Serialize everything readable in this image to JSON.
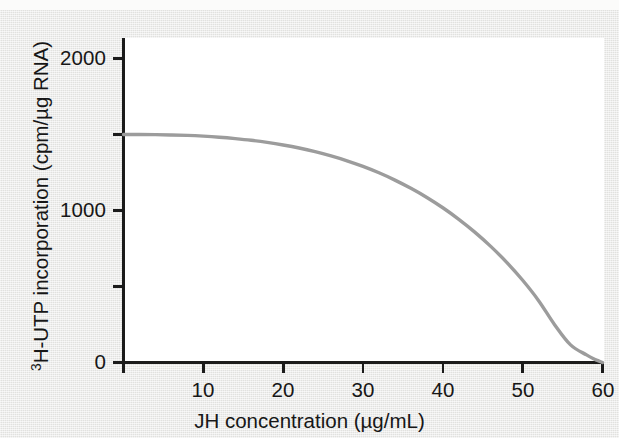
{
  "figure": {
    "background_color": "#e6e6e4",
    "panel_color": "#ffffff",
    "axis_color": "#1b1b1b"
  },
  "axis_titles": {
    "x": "JH concentration (µg/mL)",
    "y_superscript": "3",
    "y_rest": "H-UTP incorporation (cpm/µg RNA)",
    "y_full": "3H-UTP incorporation (cpm/µg RNA)"
  },
  "ticks": {
    "x_labels": [
      "10",
      "20",
      "30",
      "40",
      "50",
      "60"
    ],
    "y_labels": [
      "0",
      "1000",
      "2000"
    ]
  },
  "chart_data": {
    "type": "line",
    "title": "",
    "subtitle": "",
    "xlabel": "JH concentration (µg/mL)",
    "ylabel": "3H-UTP incorporation (cpm/µg RNA)",
    "xlim": [
      0,
      60
    ],
    "ylim": [
      0,
      2200
    ],
    "x_ticks": [
      0,
      10,
      20,
      30,
      40,
      50,
      60
    ],
    "x_tick_labels": [
      "",
      "10",
      "20",
      "30",
      "40",
      "50",
      "60"
    ],
    "y_ticks": [
      0,
      500,
      1000,
      1500,
      2000
    ],
    "y_tick_labels": [
      "0",
      "",
      "1000",
      "",
      "2000"
    ],
    "grid": false,
    "legend": false,
    "legend_position": "none",
    "series": [
      {
        "name": "3H-UTP incorporation",
        "color": "#9c9c9c",
        "line_width": 3.4,
        "markers": false,
        "x": [
          0,
          2,
          4,
          6,
          8,
          10,
          12,
          14,
          16,
          18,
          20,
          22,
          24,
          26,
          28,
          30,
          32,
          34,
          36,
          38,
          40,
          42,
          44,
          46,
          48,
          50,
          52,
          54,
          56,
          58,
          59,
          59.5,
          60
        ],
        "y": [
          1500,
          1500,
          1499,
          1497,
          1494,
          1489,
          1482,
          1473,
          1462,
          1448,
          1431,
          1411,
          1387,
          1359,
          1327,
          1290,
          1248,
          1200,
          1146,
          1086,
          1018,
          942,
          858,
          764,
          659,
          541,
          407,
          249,
          116,
          50,
          22,
          11,
          0
        ]
      }
    ],
    "annotations": []
  }
}
